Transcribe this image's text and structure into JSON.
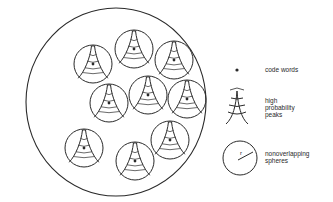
{
  "diagram": {
    "outer_sphere": {
      "cx": 116,
      "cy": 102,
      "rx": 90,
      "ry": 94
    },
    "spheres": [
      {
        "cx": 93,
        "cy": 64,
        "r": 19
      },
      {
        "cx": 134,
        "cy": 49,
        "r": 19
      },
      {
        "cx": 174,
        "cy": 60,
        "r": 19
      },
      {
        "cx": 109,
        "cy": 103,
        "r": 19
      },
      {
        "cx": 148,
        "cy": 95,
        "r": 19
      },
      {
        "cx": 187,
        "cy": 99,
        "r": 19
      },
      {
        "cx": 84,
        "cy": 148,
        "r": 19
      },
      {
        "cx": 135,
        "cy": 161,
        "r": 19
      },
      {
        "cx": 170,
        "cy": 140,
        "r": 19
      }
    ],
    "stroke_color": "#2a2a2a"
  },
  "legend": {
    "items": [
      {
        "icon": "dot-icon",
        "label": "code words"
      },
      {
        "icon": "peak-icon",
        "label_lines": [
          "high",
          "probability",
          "peaks"
        ]
      },
      {
        "icon": "sphere-radius-icon",
        "radius_label": "r",
        "label_lines": [
          "nonoverlapping",
          "spheres"
        ]
      }
    ]
  }
}
